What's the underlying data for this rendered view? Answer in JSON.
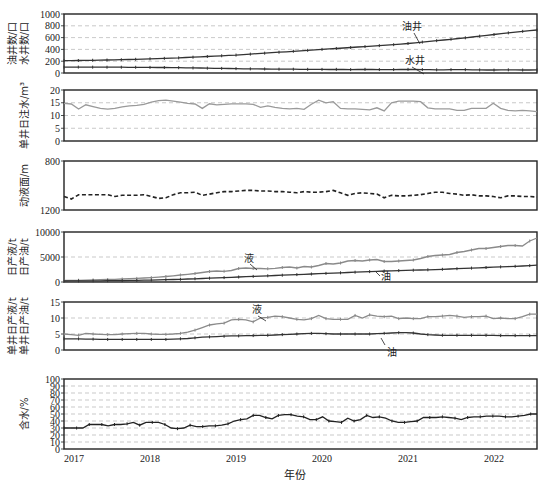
{
  "figure": {
    "x_axis_title": "年份",
    "x_tick_labels": [
      "2017",
      "2018",
      "2019",
      "2020",
      "2021",
      "2022"
    ]
  },
  "chart_data": [
    {
      "type": "line",
      "panel": 1,
      "ylabel": [
        "油井数/口",
        "水井数/口"
      ],
      "ylim": [
        0,
        1000
      ],
      "yticks": [
        0,
        200,
        400,
        600,
        800,
        1000
      ],
      "grid": "horizontal dashed",
      "annotations": [
        "油井",
        "水井"
      ],
      "x": "monthly 2017-01 to 2022-06",
      "series": [
        {
          "name": "油井",
          "color": "#333333",
          "values": [
            210,
            210,
            212,
            214,
            216,
            218,
            220,
            222,
            225,
            228,
            232,
            236,
            240,
            244,
            248,
            252,
            256,
            262,
            268,
            274,
            280,
            286,
            292,
            298,
            304,
            312,
            320,
            328,
            336,
            344,
            352,
            360,
            368,
            376,
            384,
            392,
            400,
            408,
            416,
            424,
            432,
            440,
            448,
            456,
            464,
            472,
            480,
            490,
            500,
            512,
            524,
            536,
            548,
            560,
            572,
            584,
            596,
            610,
            624,
            638,
            652,
            666,
            680,
            694,
            706,
            718,
            728
          ]
        },
        {
          "name": "水井",
          "color": "#333333",
          "values": [
            100,
            100,
            100,
            100,
            99,
            99,
            98,
            98,
            98,
            97,
            97,
            96,
            95,
            94,
            93,
            92,
            90,
            88,
            86,
            84,
            82,
            80,
            78,
            76,
            74,
            72,
            70,
            70,
            68,
            66,
            65,
            64,
            64,
            63,
            62,
            62,
            61,
            60,
            62,
            60,
            58,
            60,
            62,
            60,
            58,
            56,
            58,
            60,
            62,
            60,
            58,
            56,
            54,
            54,
            56,
            58,
            56,
            54,
            52,
            50,
            50,
            52,
            54,
            52,
            50,
            50,
            52
          ]
        }
      ]
    },
    {
      "type": "line",
      "panel": 2,
      "ylabel": "单井日注水/m³",
      "ylim": [
        0,
        20
      ],
      "yticks": [
        0,
        5,
        10,
        15,
        20
      ],
      "grid": "horizontal dashed",
      "series": [
        {
          "name": "单井日注水",
          "color": "#9a9a9a",
          "values": [
            14.8,
            14.5,
            12.5,
            14.2,
            13.5,
            12.8,
            12.5,
            12.8,
            13.4,
            13.8,
            14.0,
            14.4,
            15.2,
            15.8,
            16.0,
            15.6,
            15.2,
            14.8,
            14.5,
            12.8,
            14.6,
            14.2,
            14.4,
            14.6,
            14.6,
            14.6,
            14.4,
            13.2,
            13.8,
            13.2,
            12.8,
            12.6,
            12.8,
            12.4,
            14.4,
            16.0,
            15.0,
            15.4,
            12.8,
            12.6,
            12.6,
            12.4,
            12.2,
            13.0,
            11.8,
            15.0,
            15.6,
            15.6,
            15.6,
            15.4,
            13.0,
            12.6,
            12.6,
            12.6,
            12.0,
            12.0,
            12.8,
            12.8,
            12.8,
            14.8,
            12.8,
            12.0,
            11.8,
            12.0,
            11.8,
            11.5
          ]
        }
      ]
    },
    {
      "type": "line",
      "panel": 3,
      "ylabel": "动液面/m",
      "ylim": [
        1200,
        800
      ],
      "yticks": [
        800,
        1200
      ],
      "y_inverted": true,
      "series": [
        {
          "name": "动液面",
          "color": "#222222",
          "dash": "dashed",
          "values": [
            1090,
            1110,
            1075,
            1075,
            1075,
            1075,
            1075,
            1090,
            1080,
            1080,
            1080,
            1075,
            1090,
            1105,
            1100,
            1075,
            1060,
            1060,
            1055,
            1080,
            1070,
            1060,
            1050,
            1050,
            1045,
            1040,
            1040,
            1045,
            1045,
            1050,
            1050,
            1055,
            1060,
            1050,
            1055,
            1055,
            1050,
            1040,
            1060,
            1080,
            1065,
            1060,
            1065,
            1070,
            1100,
            1080,
            1085,
            1085,
            1080,
            1075,
            1065,
            1055,
            1055,
            1065,
            1070,
            1080,
            1075,
            1085,
            1085,
            1090,
            1100,
            1085,
            1085,
            1090,
            1090,
            1095
          ]
        }
      ]
    },
    {
      "type": "line",
      "panel": 4,
      "ylabel": [
        "日产液/t",
        "日产油/t"
      ],
      "ylim": [
        0,
        10000
      ],
      "yticks": [
        0,
        5000,
        10000
      ],
      "grid": "horizontal dashed",
      "annotations": [
        "液",
        "油"
      ],
      "series": [
        {
          "name": "液",
          "color": "#8a8a8a",
          "values": [
            300,
            320,
            350,
            380,
            420,
            460,
            500,
            540,
            600,
            660,
            720,
            800,
            880,
            980,
            1100,
            1250,
            1400,
            1550,
            1700,
            1900,
            2100,
            2200,
            2150,
            2300,
            2700,
            2800,
            2700,
            2700,
            2650,
            2750,
            2900,
            3000,
            2800,
            3100,
            3000,
            3300,
            3700,
            3600,
            3800,
            4200,
            4300,
            4200,
            4400,
            4500,
            4100,
            4100,
            4200,
            4300,
            4400,
            4700,
            5100,
            5300,
            5400,
            5500,
            5900,
            6100,
            6400,
            6700,
            6700,
            6900,
            7100,
            7300,
            7300,
            7200,
            8200,
            8800
          ]
        },
        {
          "name": "油",
          "color": "#333333",
          "values": [
            200,
            210,
            220,
            230,
            240,
            250,
            260,
            270,
            290,
            310,
            330,
            360,
            390,
            420,
            460,
            500,
            550,
            600,
            650,
            700,
            760,
            820,
            880,
            940,
            1000,
            1060,
            1120,
            1180,
            1240,
            1300,
            1360,
            1420,
            1480,
            1540,
            1600,
            1660,
            1720,
            1780,
            1840,
            1900,
            1960,
            2020,
            2080,
            2140,
            2200,
            2240,
            2280,
            2320,
            2360,
            2400,
            2440,
            2480,
            2540,
            2600,
            2660,
            2720,
            2780,
            2840,
            2900,
            2960,
            3020,
            3080,
            3140,
            3200,
            3280,
            3360
          ]
        }
      ]
    },
    {
      "type": "line",
      "panel": 5,
      "ylabel": [
        "单井日产液/t",
        "单井日产油/t"
      ],
      "ylim": [
        0,
        15
      ],
      "yticks": [
        0,
        5,
        10,
        15
      ],
      "grid": "horizontal dashed",
      "annotations": [
        "液",
        "油"
      ],
      "series": [
        {
          "name": "液",
          "color": "#8a8a8a",
          "values": [
            5.0,
            4.8,
            4.6,
            5.2,
            5.0,
            4.9,
            4.8,
            4.8,
            5.0,
            5.1,
            5.2,
            5.2,
            5.0,
            4.9,
            4.9,
            5.0,
            5.2,
            5.6,
            6.2,
            7.0,
            7.8,
            8.2,
            8.4,
            9.4,
            9.6,
            9.4,
            8.8,
            10.0,
            10.2,
            10.6,
            10.4,
            10.0,
            9.6,
            9.4,
            9.8,
            10.8,
            9.8,
            9.6,
            9.6,
            9.6,
            10.8,
            10.0,
            11.0,
            10.6,
            10.4,
            10.6,
            9.8,
            10.0,
            9.8,
            9.8,
            10.4,
            10.4,
            10.6,
            10.8,
            10.6,
            10.2,
            10.4,
            10.4,
            10.6,
            9.8,
            10.0,
            9.8,
            9.8,
            10.4,
            11.2,
            11.2
          ]
        },
        {
          "name": "油",
          "color": "#333333",
          "values": [
            3.5,
            3.5,
            3.5,
            3.4,
            3.4,
            3.3,
            3.3,
            3.3,
            3.3,
            3.3,
            3.3,
            3.3,
            3.3,
            3.3,
            3.3,
            3.4,
            3.5,
            3.6,
            3.8,
            4.0,
            4.1,
            4.2,
            4.3,
            4.4,
            4.4,
            4.5,
            4.5,
            4.6,
            4.6,
            4.7,
            4.8,
            4.9,
            5.0,
            5.1,
            5.2,
            5.2,
            5.1,
            5.0,
            5.0,
            5.0,
            5.0,
            5.0,
            5.0,
            5.1,
            5.2,
            5.3,
            5.4,
            5.4,
            5.3,
            5.0,
            4.8,
            4.7,
            4.6,
            4.6,
            4.6,
            4.6,
            4.6,
            4.6,
            4.6,
            4.6,
            4.5,
            4.5,
            4.5,
            4.5,
            4.5,
            4.5
          ]
        }
      ]
    },
    {
      "type": "line",
      "panel": 6,
      "ylabel": "含水/%",
      "ylim": [
        0,
        100
      ],
      "yticks": [
        0,
        10,
        20,
        30,
        40,
        50,
        60,
        70,
        80,
        90,
        100
      ],
      "grid": "horizontal dashed",
      "series": [
        {
          "name": "含水",
          "color": "#222222",
          "values": [
            30,
            30,
            30,
            30,
            35,
            35,
            35,
            33,
            35,
            35,
            36,
            38,
            34,
            38,
            38,
            38,
            35,
            30,
            29,
            30,
            34,
            32,
            32,
            33,
            33,
            34,
            36,
            40,
            42,
            43,
            48,
            48,
            45,
            43,
            48,
            49,
            49,
            47,
            46,
            42,
            42,
            46,
            40,
            39,
            38,
            44,
            40,
            42,
            48,
            45,
            46,
            44,
            40,
            38,
            38,
            39,
            40,
            45,
            45,
            45,
            46,
            45,
            44,
            42,
            45,
            46,
            46,
            47,
            47,
            47,
            46,
            46,
            47,
            48,
            50,
            50
          ]
        }
      ]
    }
  ]
}
